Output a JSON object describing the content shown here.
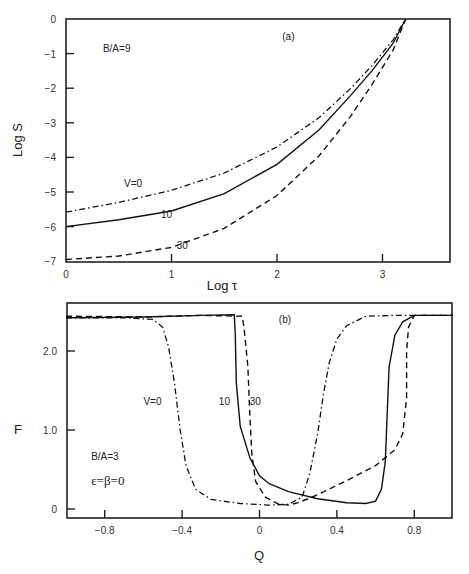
{
  "chart_data": [
    {
      "type": "line",
      "panel_label": "(a)",
      "title": "",
      "xlabel": "Log τ",
      "ylabel": "Log S",
      "xlim": [
        0,
        3.6
      ],
      "ylim": [
        -7,
        0
      ],
      "xticks": [
        0,
        1,
        2,
        3
      ],
      "xtick_labels": [
        "0",
        "1",
        "2",
        "3"
      ],
      "yticks": [
        0,
        -1,
        -2,
        -3,
        -4,
        -5,
        -6,
        -7
      ],
      "ytick_labels": [
        "0",
        "−1",
        "−2",
        "−3",
        "−4",
        "−5",
        "−6",
        "−7"
      ],
      "grid": false,
      "annotations": [
        {
          "text": "B/A=9",
          "x": 0.35,
          "y": -0.95
        },
        {
          "text": "(a)",
          "x": 2.05,
          "y": -0.6
        },
        {
          "text": "V=0",
          "x": 0.55,
          "y": -4.85
        },
        {
          "text": "10",
          "x": 0.9,
          "y": -5.75
        },
        {
          "text": "30",
          "x": 1.05,
          "y": -6.65
        }
      ],
      "series": [
        {
          "name": "V=0",
          "style": "dashdot",
          "x": [
            0,
            0.5,
            1.0,
            1.5,
            2.0,
            2.4,
            2.7,
            2.9,
            3.1,
            3.22
          ],
          "y": [
            -5.58,
            -5.3,
            -4.95,
            -4.45,
            -3.7,
            -2.85,
            -2.0,
            -1.35,
            -0.6,
            0
          ]
        },
        {
          "name": "10",
          "style": "solid",
          "x": [
            0,
            0.5,
            1.0,
            1.5,
            2.0,
            2.4,
            2.7,
            2.9,
            3.1,
            3.22
          ],
          "y": [
            -6.0,
            -5.8,
            -5.55,
            -5.05,
            -4.2,
            -3.2,
            -2.2,
            -1.5,
            -0.7,
            0
          ]
        },
        {
          "name": "30",
          "style": "dashed",
          "x": [
            0,
            0.5,
            1.0,
            1.5,
            2.0,
            2.4,
            2.7,
            2.9,
            3.1,
            3.22
          ],
          "y": [
            -6.95,
            -6.85,
            -6.6,
            -6.05,
            -5.1,
            -3.95,
            -2.8,
            -1.9,
            -0.9,
            0
          ]
        }
      ]
    },
    {
      "type": "line",
      "panel_label": "(b)",
      "title": "",
      "xlabel": "Q",
      "ylabel": "F",
      "xlim": [
        -1.0,
        1.0
      ],
      "ylim": [
        -0.12,
        2.6
      ],
      "xticks": [
        -0.8,
        -0.4,
        0,
        0.4,
        0.8
      ],
      "xtick_labels": [
        "−0.8",
        "−0.4",
        "0",
        "0.4",
        "0.8"
      ],
      "yticks": [
        0,
        1.0,
        2.0
      ],
      "ytick_labels": [
        "0",
        "1.0",
        "2.0"
      ],
      "grid": false,
      "annotations": [
        {
          "text": "(b)",
          "x": 0.1,
          "y": 2.36
        },
        {
          "text": "V=0",
          "x": -0.6,
          "y": 1.32
        },
        {
          "text": "10",
          "x": -0.21,
          "y": 1.32
        },
        {
          "text": "30",
          "x": -0.05,
          "y": 1.32
        },
        {
          "text": "B/A=3",
          "x": -0.87,
          "y": 0.62
        },
        {
          "text": "ε=β=0",
          "x": -0.87,
          "y": 0.3
        }
      ],
      "series": [
        {
          "name": "V=0",
          "style": "dashdot",
          "x": [
            -1.0,
            -0.7,
            -0.55,
            -0.5,
            -0.47,
            -0.44,
            -0.41,
            -0.38,
            -0.33,
            -0.25,
            -0.1,
            0.05,
            0.15,
            0.22,
            0.26,
            0.3,
            0.33,
            0.36,
            0.4,
            0.45,
            0.55,
            0.7,
            0.85,
            1.0
          ],
          "y": [
            2.42,
            2.42,
            2.4,
            2.3,
            2.05,
            1.6,
            1.0,
            0.55,
            0.25,
            0.12,
            0.07,
            0.05,
            0.06,
            0.15,
            0.45,
            0.95,
            1.45,
            1.85,
            2.15,
            2.32,
            2.44,
            2.45,
            2.45,
            2.45
          ]
        },
        {
          "name": "10",
          "style": "solid",
          "x": [
            -1.0,
            -0.6,
            -0.3,
            -0.13,
            -0.125,
            -0.12,
            -0.1,
            -0.05,
            0.0,
            0.05,
            0.15,
            0.3,
            0.45,
            0.55,
            0.6,
            0.63,
            0.65,
            0.66,
            0.67,
            0.7,
            0.74,
            0.8,
            1.0
          ],
          "y": [
            2.42,
            2.43,
            2.45,
            2.46,
            2.2,
            1.6,
            1.05,
            0.65,
            0.42,
            0.32,
            0.22,
            0.13,
            0.08,
            0.07,
            0.1,
            0.25,
            0.6,
            1.2,
            1.8,
            2.2,
            2.37,
            2.45,
            2.45
          ]
        },
        {
          "name": "30",
          "style": "dashed",
          "x": [
            -1.0,
            -0.6,
            -0.3,
            -0.09,
            -0.08,
            -0.06,
            -0.05,
            -0.04,
            -0.02,
            0.03,
            0.1,
            0.15,
            0.2,
            0.3,
            0.45,
            0.6,
            0.7,
            0.74,
            0.76,
            0.76,
            0.77,
            0.8,
            1.0
          ],
          "y": [
            2.44,
            2.43,
            2.45,
            2.44,
            2.3,
            1.8,
            1.2,
            0.7,
            0.35,
            0.15,
            0.06,
            0.05,
            0.08,
            0.18,
            0.36,
            0.55,
            0.75,
            0.95,
            1.4,
            2.0,
            2.3,
            2.45,
            2.45
          ]
        }
      ]
    }
  ]
}
